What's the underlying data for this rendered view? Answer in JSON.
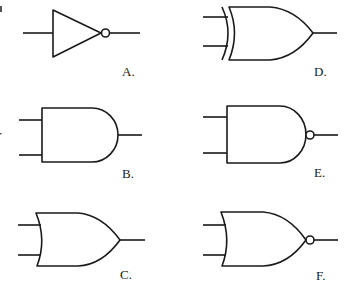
{
  "diagram": {
    "title": "",
    "type": "logic-gate-symbols",
    "gates": [
      {
        "id": "A",
        "label": "A.",
        "gate_type": "NOT",
        "inputs": 1,
        "inverted_output": true
      },
      {
        "id": "B",
        "label": "B.",
        "gate_type": "AND",
        "inputs": 2,
        "inverted_output": false
      },
      {
        "id": "C",
        "label": "C.",
        "gate_type": "OR",
        "inputs": 2,
        "inverted_output": false
      },
      {
        "id": "D",
        "label": "D.",
        "gate_type": "XOR",
        "inputs": 2,
        "inverted_output": false
      },
      {
        "id": "E",
        "label": "E.",
        "gate_type": "NAND",
        "inputs": 2,
        "inverted_output": true
      },
      {
        "id": "F",
        "label": "F.",
        "gate_type": "NOR",
        "inputs": 2,
        "inverted_output": true
      }
    ],
    "colors": {
      "stroke": "#1a1a1a",
      "background": "#ffffff"
    }
  }
}
